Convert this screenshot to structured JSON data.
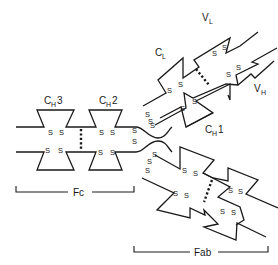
{
  "diagram": {
    "colors": {
      "line": "#1a1a1a",
      "background": "#ffffff"
    },
    "domain_labels": {
      "ch3": {
        "main": "C",
        "sub": "H",
        "suffix": "3"
      },
      "ch2": {
        "main": "C",
        "sub": "H",
        "suffix": "2"
      },
      "ch1": {
        "main": "C",
        "sub": "H",
        "suffix": "1"
      },
      "cl": {
        "main": "C",
        "sub": "L",
        "suffix": ""
      },
      "vl": {
        "main": "V",
        "sub": "L",
        "suffix": ""
      },
      "vh": {
        "main": "V",
        "sub": "H",
        "suffix": ""
      }
    },
    "disulfide_symbol": "S",
    "fragments": {
      "fc": "Fc",
      "fab": "Fab"
    }
  }
}
